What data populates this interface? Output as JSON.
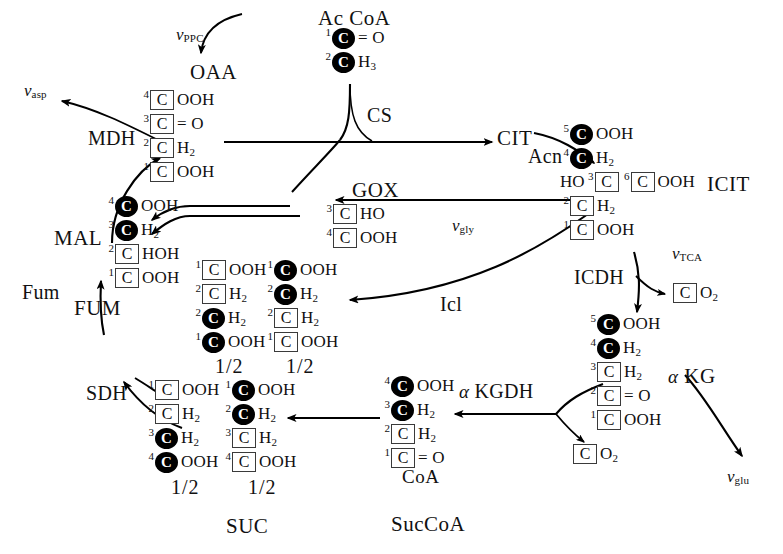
{
  "diagram": {
    "width": 783,
    "height": 554,
    "stroke_color": "#000000",
    "box_color": "#3a3a3a",
    "labeled_carbon_color": "#000000"
  },
  "metabolites": {
    "oaa": "OAA",
    "ac_coa": "Ac CoA",
    "cit": "CIT",
    "icit": "ICIT",
    "gox": "GOX",
    "mal": "MAL",
    "fum": "FUM",
    "suc": "SUC",
    "succoa": "SucCoA",
    "coa": "CoA",
    "akg": "KG",
    "akg_prefix": "α"
  },
  "enzymes": {
    "cs": "CS",
    "acn": "Acn",
    "icdh": "ICDH",
    "akgdh": "KGDH",
    "akgdh_prefix": "α",
    "sdh": "SDH",
    "fum": "Fum",
    "mdh": "MDH",
    "icl": "Icl"
  },
  "fluxes": {
    "vppc": {
      "sym": "v",
      "sub": "PPC"
    },
    "vasp": {
      "sym": "v",
      "sub": "asp"
    },
    "vgly": {
      "sym": "v",
      "sub": "gly"
    },
    "vtca": {
      "sym": "v",
      "sub": "TCA"
    },
    "vglu": {
      "sym": "v",
      "sub": "glu"
    }
  },
  "stoich_labels": {
    "half": "1/2"
  },
  "molecules": {
    "ac_coa": {
      "name": "Ac CoA",
      "rows": [
        {
          "idx": "1",
          "pre": "",
          "carbon": "filled",
          "tail": "= O"
        },
        {
          "idx": "2",
          "pre": "",
          "carbon": "filled",
          "tail": "H3"
        }
      ]
    },
    "oaa": {
      "name": "OAA",
      "rows": [
        {
          "idx": "4",
          "pre": "",
          "carbon": "open",
          "tail": "OOH"
        },
        {
          "idx": "3",
          "pre": "",
          "carbon": "open",
          "tail": "= O"
        },
        {
          "idx": "2",
          "pre": "",
          "carbon": "open",
          "tail": "H2"
        },
        {
          "idx": "1",
          "pre": "",
          "carbon": "open",
          "tail": "OOH"
        }
      ]
    },
    "icit": {
      "name": "ICIT",
      "rows": [
        {
          "idx": "5",
          "pre": "",
          "carbon": "filled",
          "tail": "OOH"
        },
        {
          "idx": "4",
          "pre": "",
          "carbon": "filled",
          "tail": "H2"
        },
        {
          "idx": "3",
          "pre": "HO",
          "carbon": "open",
          "tail": "",
          "second": {
            "idx": "6",
            "carbon": "open",
            "tail": "OOH"
          }
        },
        {
          "idx": "2",
          "pre": "",
          "carbon": "open",
          "tail": "H2"
        },
        {
          "idx": "1",
          "pre": "",
          "carbon": "open",
          "tail": "OOH"
        }
      ]
    },
    "gox": {
      "name": "GOX",
      "rows": [
        {
          "idx": "3",
          "pre": "",
          "carbon": "open",
          "tail": "HO"
        },
        {
          "idx": "4",
          "pre": "",
          "carbon": "open",
          "tail": "OOH"
        }
      ]
    },
    "mal": {
      "name": "MAL",
      "rows": [
        {
          "idx": "4",
          "pre": "",
          "carbon": "filled",
          "tail": "OOH"
        },
        {
          "idx": "3",
          "pre": "",
          "carbon": "filled",
          "tail": "H2"
        },
        {
          "idx": "2",
          "pre": "",
          "carbon": "open",
          "tail": "HOH"
        },
        {
          "idx": "1",
          "pre": "",
          "carbon": "open",
          "tail": "OOH"
        }
      ]
    },
    "mal_iso_a": {
      "name": "MAL-isotopomer-A",
      "half": "1/2",
      "rows": [
        {
          "idx": "1",
          "pre": "",
          "carbon": "open",
          "tail": "OOH"
        },
        {
          "idx": "2",
          "pre": "",
          "carbon": "open",
          "tail": "H2"
        },
        {
          "idx": "2",
          "pre": "",
          "carbon": "filled",
          "tail": "H2"
        },
        {
          "idx": "1",
          "pre": "",
          "carbon": "filled",
          "tail": "OOH"
        }
      ]
    },
    "mal_iso_b": {
      "name": "MAL-isotopomer-B",
      "half": "1/2",
      "rows": [
        {
          "idx": "1",
          "pre": "",
          "carbon": "filled",
          "tail": "OOH"
        },
        {
          "idx": "2",
          "pre": "",
          "carbon": "filled",
          "tail": "H2"
        },
        {
          "idx": "2",
          "pre": "",
          "carbon": "open",
          "tail": "H2"
        },
        {
          "idx": "1",
          "pre": "",
          "carbon": "open",
          "tail": "OOH"
        }
      ]
    },
    "suc_iso_a": {
      "name": "SUC-isotopomer-A",
      "half": "1/2",
      "rows": [
        {
          "idx": "1",
          "pre": "",
          "carbon": "open",
          "tail": "OOH"
        },
        {
          "idx": "2",
          "pre": "",
          "carbon": "open",
          "tail": "H2"
        },
        {
          "idx": "3",
          "pre": "",
          "carbon": "filled",
          "tail": "H2"
        },
        {
          "idx": "4",
          "pre": "",
          "carbon": "filled",
          "tail": "OOH"
        }
      ]
    },
    "suc_iso_b": {
      "name": "SUC-isotopomer-B",
      "half": "1/2",
      "rows": [
        {
          "idx": "1",
          "pre": "",
          "carbon": "filled",
          "tail": "OOH"
        },
        {
          "idx": "2",
          "pre": "",
          "carbon": "filled",
          "tail": "H2"
        },
        {
          "idx": "3",
          "pre": "",
          "carbon": "open",
          "tail": "H2"
        },
        {
          "idx": "4",
          "pre": "",
          "carbon": "open",
          "tail": "OOH"
        }
      ]
    },
    "succoa": {
      "name": "SucCoA",
      "rows": [
        {
          "idx": "4",
          "pre": "",
          "carbon": "filled",
          "tail": "OOH"
        },
        {
          "idx": "3",
          "pre": "",
          "carbon": "filled",
          "tail": "H2"
        },
        {
          "idx": "2",
          "pre": "",
          "carbon": "open",
          "tail": "H2"
        },
        {
          "idx": "1",
          "pre": "",
          "carbon": "open",
          "tail": "= O"
        }
      ]
    },
    "akg": {
      "name": "alpha-KG",
      "rows": [
        {
          "idx": "5",
          "pre": "",
          "carbon": "filled",
          "tail": "OOH"
        },
        {
          "idx": "4",
          "pre": "",
          "carbon": "filled",
          "tail": "H2"
        },
        {
          "idx": "3",
          "pre": "",
          "carbon": "open",
          "tail": "H2"
        },
        {
          "idx": "2",
          "pre": "",
          "carbon": "open",
          "tail": "= O"
        },
        {
          "idx": "1",
          "pre": "",
          "carbon": "open",
          "tail": "OOH"
        }
      ]
    },
    "co2_icdh": {
      "name": "CO2-from-ICDH",
      "carbon": "open",
      "tail": "O2"
    },
    "co2_akgdh": {
      "name": "CO2-from-KGDH",
      "carbon": "open",
      "tail": "O2"
    }
  },
  "chart_data": {
    "type": "diagram",
    "nodes": [
      "OAA",
      "Ac CoA",
      "CIT",
      "ICIT",
      "GOX",
      "MAL",
      "FUM",
      "SUC",
      "SucCoA",
      "alpha-KG",
      "CO2"
    ],
    "edges": [
      {
        "from": "OAA + Ac CoA",
        "to": "CIT",
        "enzyme": "CS"
      },
      {
        "from": "CIT",
        "to": "ICIT",
        "enzyme": "Acn"
      },
      {
        "from": "ICIT",
        "to": "alpha-KG + CO2",
        "enzyme": "ICDH",
        "flux": "vTCA"
      },
      {
        "from": "alpha-KG",
        "to": "SucCoA + CO2",
        "enzyme": "alpha-KGDH"
      },
      {
        "from": "SucCoA",
        "to": "SUC",
        "enzyme": ""
      },
      {
        "from": "SUC",
        "to": "FUM",
        "enzyme": "SDH"
      },
      {
        "from": "FUM",
        "to": "MAL",
        "enzyme": "Fum"
      },
      {
        "from": "MAL",
        "to": "OAA",
        "enzyme": "MDH"
      },
      {
        "from": "ICIT",
        "to": "GOX",
        "enzyme": "",
        "flux": "vgly"
      },
      {
        "from": "ICIT",
        "to": "SUC-isotopomers",
        "enzyme": "Icl"
      },
      {
        "from": "GOX",
        "to": "MAL",
        "enzyme": ""
      },
      {
        "from": "inflow",
        "to": "OAA",
        "flux": "vPPC"
      },
      {
        "from": "OAA",
        "to": "aspartate",
        "flux": "vasp"
      },
      {
        "from": "alpha-KG",
        "to": "glutamate",
        "flux": "vglu"
      }
    ]
  }
}
